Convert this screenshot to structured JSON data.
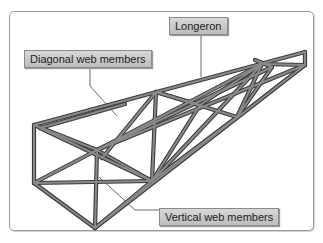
{
  "diagram": {
    "type": "truss fuselage structure (3D line illustration)",
    "colors": {
      "member_fill": "#7a7a7a",
      "member_edge": "#3c3c3c",
      "leader_line": "#6b6b6b",
      "label_bg": "#cfcfcf",
      "frame_border": "#9a9a9a"
    },
    "labels": [
      {
        "id": "longeron",
        "text": "Longeron"
      },
      {
        "id": "diagonal",
        "text": "Diagonal web members"
      },
      {
        "id": "vertical",
        "text": "Vertical web members"
      }
    ]
  }
}
